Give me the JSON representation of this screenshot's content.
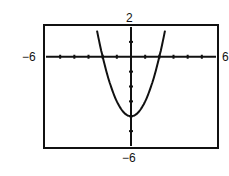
{
  "chart_data": {
    "type": "line",
    "title": "",
    "xlabel": "",
    "ylabel": "",
    "window": {
      "xmin": -6,
      "xmax": 6,
      "ymin": -6,
      "ymax": 2,
      "xscl": 1,
      "yscl": 1
    },
    "xlim": [
      -6,
      6
    ],
    "ylim": [
      -6,
      2
    ],
    "grid": false,
    "legend": null,
    "labels": {
      "xmin": "−6",
      "xmax": "6",
      "ymin": "−6",
      "ymax": "2"
    },
    "series": [
      {
        "name": "y = x^2 - 4",
        "x": [
          -2.45,
          -2,
          -1.5,
          -1,
          -0.5,
          0,
          0.5,
          1,
          1.5,
          2,
          2.45
        ],
        "y": [
          2,
          0,
          -1.75,
          -3,
          -3.75,
          -4,
          -3.75,
          -3,
          -1.75,
          0,
          2
        ]
      }
    ],
    "annotations": {
      "vertex": [
        0,
        -4
      ],
      "x_intercepts": [
        -2,
        2
      ]
    }
  },
  "colors": {
    "ink": "#111111",
    "background": "#ffffff"
  }
}
